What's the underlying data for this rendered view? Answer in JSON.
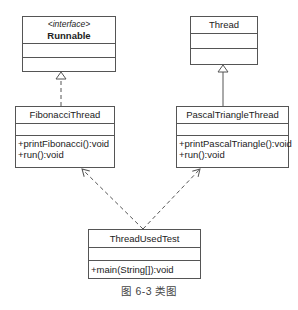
{
  "diagram": {
    "type": "uml-class-diagram",
    "classes": {
      "runnable": {
        "stereotype": "<interface>",
        "name": "Runnable",
        "attributes": [],
        "methods": []
      },
      "thread": {
        "name": "Thread",
        "attributes": [],
        "methods": []
      },
      "fibonacci": {
        "name": "FibonacciThread",
        "attributes": [],
        "methods": [
          "+printFibonacci():void",
          "+run():void"
        ]
      },
      "pascal": {
        "name": "PascalTriangleThread",
        "attributes": [],
        "methods": [
          "+printPascalTriangle():void",
          "+run():void"
        ]
      },
      "test": {
        "name": "ThreadUsedTest",
        "attributes": [],
        "methods": [
          "+main(String[]):void"
        ]
      }
    },
    "relationships": [
      {
        "from": "FibonacciThread",
        "to": "Runnable",
        "kind": "realization"
      },
      {
        "from": "PascalTriangleThread",
        "to": "Thread",
        "kind": "generalization"
      },
      {
        "from": "ThreadUsedTest",
        "to": "FibonacciThread",
        "kind": "dependency"
      },
      {
        "from": "ThreadUsedTest",
        "to": "PascalTriangleThread",
        "kind": "dependency"
      }
    ],
    "caption": "图 6-3   类图",
    "colors": {
      "line": "#555555",
      "text": "#222222",
      "background": "#ffffff"
    }
  }
}
